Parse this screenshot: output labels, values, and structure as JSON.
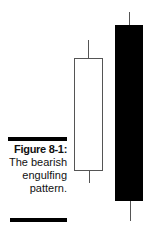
{
  "figure": {
    "label": "Figure 8-1:",
    "caption_lines": [
      "The bearish",
      "engulfing",
      "pattern."
    ]
  },
  "candles": [
    {
      "type": "bullish",
      "color": "#ffffff",
      "border": "#555555"
    },
    {
      "type": "bearish",
      "color": "#000000"
    }
  ]
}
